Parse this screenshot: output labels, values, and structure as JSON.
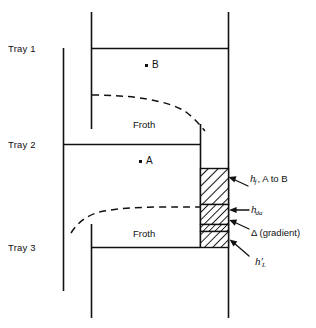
{
  "figure": {
    "line_color": "#111111",
    "background": "#ffffff"
  },
  "trays": [
    {
      "id": "tray-1",
      "label": "Tray 1"
    },
    {
      "id": "tray-2",
      "label": "Tray 2"
    },
    {
      "id": "tray-3",
      "label": "Tray 3"
    }
  ],
  "froth_labels": [
    {
      "id": "froth-upper",
      "label": "Froth"
    },
    {
      "id": "froth-lower",
      "label": "Froth"
    }
  ],
  "points": [
    {
      "id": "point-b",
      "label": "B"
    },
    {
      "id": "point-a",
      "label": "A"
    }
  ],
  "annotations": [
    {
      "id": "h-f",
      "symbol": "h",
      "subscript": "f",
      "suffix": ", A to B",
      "plain": "h_f, A to B"
    },
    {
      "id": "h-da",
      "symbol": "h",
      "subscript": "da",
      "suffix": "",
      "plain": "h_da"
    },
    {
      "id": "delta-gradient",
      "symbol": "Δ",
      "subscript": "",
      "suffix": " (gradient)",
      "plain": "Δ (gradient)"
    },
    {
      "id": "h-l-prime",
      "symbol": "h′",
      "subscript": "L",
      "suffix": "",
      "plain": "h′_L"
    }
  ]
}
